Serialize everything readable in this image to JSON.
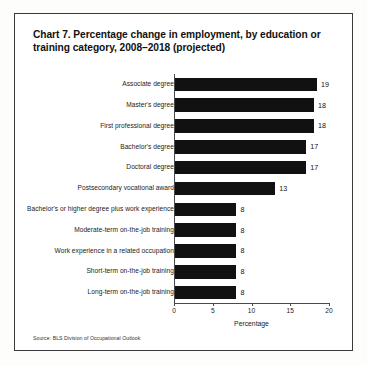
{
  "chart_data": {
    "type": "bar",
    "orientation": "horizontal",
    "title": "Chart 7. Percentage change in employment, by education or training category, 2008–2018 (projected)",
    "categories": [
      "Associate degree",
      "Master's degree",
      "First professional degree",
      "Bachelor's degree",
      "Doctoral degree",
      "Postsecondary vocational award",
      "Bachelor's or higher degree plus work experience",
      "Moderate-term on-the-job training",
      "Work experience in a related occupation",
      "Short-term on-the-job training",
      "Long-term on-the-job training"
    ],
    "values": [
      19,
      18,
      18,
      17,
      17,
      13,
      8,
      8,
      8,
      8,
      8
    ],
    "value_labels": [
      "19",
      "18",
      "18",
      "17",
      "17",
      "13",
      "8",
      "8",
      "8",
      "8",
      "8"
    ],
    "xlabel": "Percentage",
    "ylabel": "",
    "xlim": [
      0,
      20
    ],
    "xticks": [
      0,
      5,
      10,
      15,
      20
    ],
    "xtick_labels": [
      "0",
      "5",
      "10",
      "15",
      "20"
    ],
    "grid": false,
    "legend": false,
    "bar_color": "#111111",
    "source": "Source: BLS Division of Occupational Outlook"
  }
}
